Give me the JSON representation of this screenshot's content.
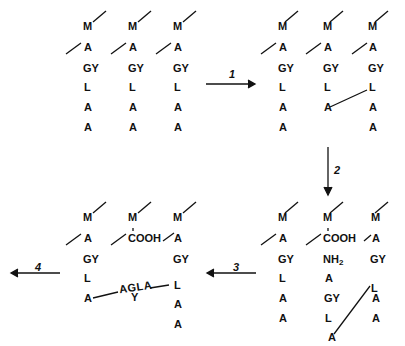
{
  "panels": {
    "top_left": {
      "columns": [
        [
          "M",
          "A",
          "GY",
          "L",
          "A",
          "A"
        ],
        [
          "M",
          "A",
          "GY",
          "L",
          "A",
          "A"
        ],
        [
          "M",
          "A",
          "GY",
          "L",
          "A",
          "A"
        ]
      ]
    },
    "top_right": {
      "columns": [
        [
          "M",
          "A",
          "GY",
          "L",
          "A",
          "A"
        ],
        [
          "M",
          "A",
          "GY",
          "L",
          "A"
        ],
        [
          "M",
          "A",
          "GY",
          "L",
          "A",
          "A"
        ]
      ],
      "note": "Column 2 terminal A bonded to column 3 L"
    },
    "bottom_right": {
      "columns": [
        [
          "M",
          "A",
          "GY",
          "L",
          "A",
          "A"
        ],
        [
          "M",
          "COOH",
          "NH2",
          "A",
          "GY",
          "L",
          "A"
        ],
        [
          "M",
          "A",
          "GY",
          "L",
          "A",
          "A"
        ]
      ],
      "nh2_main": "NH",
      "nh2_sub": "2"
    },
    "bottom_left": {
      "columns": [
        [
          "M",
          "A",
          "GY",
          "L",
          "A"
        ],
        [
          "M",
          "COOH"
        ],
        [
          "M",
          "A",
          "GY",
          "L",
          "A",
          "A"
        ]
      ],
      "bridge_top": "AGLA",
      "bridge_bottom": "Y"
    }
  },
  "arrows": [
    {
      "label": "1",
      "direction": "right"
    },
    {
      "label": "2",
      "direction": "down"
    },
    {
      "label": "3",
      "direction": "left"
    },
    {
      "label": "4",
      "direction": "left"
    }
  ],
  "colors": {
    "ink": "#111111",
    "background": "#ffffff"
  }
}
